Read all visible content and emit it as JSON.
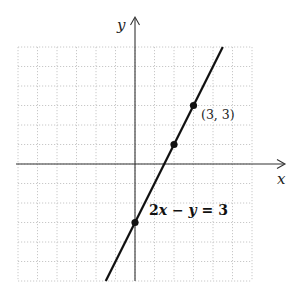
{
  "chart_data": {
    "type": "line",
    "title": "",
    "xlabel": "x",
    "ylabel": "y",
    "xlim": [
      -6,
      6
    ],
    "ylim": [
      -6,
      6
    ],
    "grid": true,
    "grid_style": "dotted",
    "series": [
      {
        "name": "2x - y = 3",
        "equation": "2x − y = 3",
        "slope": 2,
        "intercept": -3,
        "segment": [
          [
            -1.5,
            -6
          ],
          [
            4.5,
            6
          ]
        ]
      }
    ],
    "points": [
      {
        "x": 0,
        "y": -3,
        "label": ""
      },
      {
        "x": 2,
        "y": 1,
        "label": ""
      },
      {
        "x": 3,
        "y": 3,
        "label": "(3, 3)"
      }
    ],
    "annotations": [
      {
        "text": "2x − y = 3",
        "near": [
          0,
          -3
        ]
      },
      {
        "text": "(3, 3)",
        "near": [
          3,
          3
        ]
      }
    ]
  },
  "labels": {
    "x_axis": "x",
    "y_axis": "y",
    "point_label": "(3, 3)",
    "equation_parts": {
      "a": "2",
      "x": "x",
      "minus": " − ",
      "y": "y",
      "rest": " = 3"
    }
  }
}
